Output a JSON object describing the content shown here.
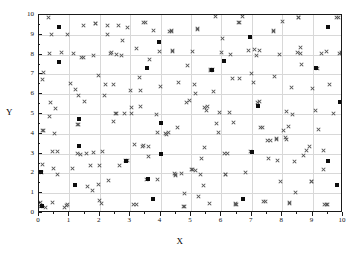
{
  "chart_data": {
    "type": "scatter",
    "title": "",
    "xlabel": "X",
    "ylabel": "Y",
    "xlim": [
      0,
      10
    ],
    "ylim": [
      0,
      10
    ],
    "xticks": [
      0,
      1,
      2,
      3,
      4,
      5,
      6,
      7,
      8,
      9,
      10
    ],
    "yticks": [
      0,
      1,
      2,
      3,
      4,
      5,
      6,
      7,
      8,
      9,
      10
    ],
    "xticklabels": [
      "0",
      "1",
      "2",
      "3",
      "4",
      "5",
      "6",
      "7",
      "8",
      "9",
      "10"
    ],
    "yticklabels": [
      "0",
      "1",
      "2",
      "3",
      "4",
      "5",
      "6",
      "7",
      "8",
      "9",
      "10"
    ],
    "grid": true,
    "minor_ticks": true,
    "legend": null,
    "series": [
      {
        "name": "cross-series",
        "marker": "x",
        "color": "#555555",
        "points": [
          [
            0.05,
            0.35
          ],
          [
            0.05,
            0.55
          ],
          [
            0.08,
            2.05
          ],
          [
            0.1,
            2.45
          ],
          [
            0.12,
            4.15
          ],
          [
            0.1,
            6.75
          ],
          [
            0.15,
            7.1
          ],
          [
            0.3,
            9.85
          ],
          [
            0.35,
            4.85
          ],
          [
            0.38,
            5.6
          ],
          [
            0.4,
            9.0
          ],
          [
            0.45,
            3.1
          ],
          [
            0.48,
            2.25
          ],
          [
            0.5,
            4.0
          ],
          [
            0.55,
            5.3
          ],
          [
            0.6,
            1.95
          ],
          [
            0.75,
            8.1
          ],
          [
            0.85,
            0.3
          ],
          [
            0.9,
            0.4
          ],
          [
            0.95,
            0.45
          ],
          [
            1.05,
            6.55
          ],
          [
            1.1,
            2.25
          ],
          [
            1.15,
            8.05
          ],
          [
            1.2,
            6.25
          ],
          [
            1.25,
            4.45
          ],
          [
            1.3,
            5.95
          ],
          [
            1.35,
            2.95
          ],
          [
            1.4,
            7.85
          ],
          [
            1.45,
            9.45
          ],
          [
            1.5,
            5.65
          ],
          [
            1.55,
            3.0
          ],
          [
            1.6,
            1.35
          ],
          [
            1.7,
            2.4
          ],
          [
            1.75,
            1.15
          ],
          [
            1.78,
            7.95
          ],
          [
            1.8,
            3.05
          ],
          [
            1.85,
            9.55
          ],
          [
            1.95,
            6.95
          ],
          [
            2.0,
            0.65
          ],
          [
            2.05,
            0.5
          ],
          [
            2.1,
            3.1
          ],
          [
            2.15,
            5.95
          ],
          [
            2.2,
            6.5
          ],
          [
            2.25,
            9.0
          ],
          [
            2.3,
            1.65
          ],
          [
            2.4,
            8.1
          ],
          [
            2.45,
            4.6
          ],
          [
            2.5,
            5.05
          ],
          [
            2.55,
            8.0
          ],
          [
            2.6,
            9.45
          ],
          [
            2.65,
            2.4
          ],
          [
            2.7,
            7.95
          ],
          [
            2.75,
            8.7
          ],
          [
            2.8,
            5.05
          ],
          [
            2.85,
            2.65
          ],
          [
            2.9,
            9.35
          ],
          [
            3.0,
            6.2
          ],
          [
            3.05,
            5.35
          ],
          [
            3.1,
            0.45
          ],
          [
            3.15,
            3.45
          ],
          [
            3.2,
            8.3
          ],
          [
            3.3,
            6.85
          ],
          [
            3.35,
            5.4
          ],
          [
            3.4,
            3.35
          ],
          [
            3.45,
            3.4
          ],
          [
            3.5,
            9.6
          ],
          [
            3.55,
            1.7
          ],
          [
            3.6,
            2.85
          ],
          [
            3.65,
            7.75
          ],
          [
            3.75,
            9.2
          ],
          [
            3.85,
            4.95
          ],
          [
            3.9,
            4.05
          ],
          [
            3.95,
            8.15
          ],
          [
            4.0,
            6.4
          ],
          [
            4.15,
            4.0
          ],
          [
            4.2,
            3.95
          ],
          [
            4.3,
            9.15
          ],
          [
            4.35,
            9.15
          ],
          [
            4.4,
            8.15
          ],
          [
            4.45,
            2.0
          ],
          [
            4.5,
            1.9
          ],
          [
            4.55,
            4.3
          ],
          [
            4.6,
            6.6
          ],
          [
            4.7,
            2.0
          ],
          [
            4.75,
            0.35
          ],
          [
            4.8,
            1.0
          ],
          [
            4.85,
            5.6
          ],
          [
            4.9,
            7.45
          ],
          [
            4.95,
            5.7
          ],
          [
            5.0,
            2.2
          ],
          [
            5.05,
            2.2
          ],
          [
            5.1,
            6.5
          ],
          [
            5.15,
            6.05
          ],
          [
            5.2,
            9.3
          ],
          [
            5.25,
            0.85
          ],
          [
            5.3,
            1.95
          ],
          [
            5.35,
            2.75
          ],
          [
            5.4,
            1.4
          ],
          [
            5.45,
            3.3
          ],
          [
            5.5,
            5.2
          ],
          [
            5.55,
            5.4
          ],
          [
            5.6,
            0.5
          ],
          [
            5.65,
            7.2
          ],
          [
            5.7,
            7.25
          ],
          [
            5.75,
            6.15
          ],
          [
            5.8,
            9.9
          ],
          [
            5.85,
            4.5
          ],
          [
            5.9,
            4.05
          ],
          [
            5.95,
            5.1
          ],
          [
            6.0,
            8.1
          ],
          [
            6.05,
            8.8
          ],
          [
            6.1,
            3.0
          ],
          [
            6.15,
            1.95
          ],
          [
            6.2,
            3.0
          ],
          [
            6.3,
            8.0
          ],
          [
            6.35,
            6.8
          ],
          [
            6.4,
            4.55
          ],
          [
            6.45,
            0.5
          ],
          [
            6.5,
            0.45
          ],
          [
            6.6,
            9.6
          ],
          [
            6.7,
            9.9
          ],
          [
            6.8,
            2.05
          ],
          [
            6.9,
            8.2
          ],
          [
            7.0,
            7.05
          ],
          [
            7.05,
            6.6
          ],
          [
            7.1,
            8.25
          ],
          [
            7.15,
            7.95
          ],
          [
            7.2,
            5.6
          ],
          [
            7.25,
            5.65
          ],
          [
            7.3,
            4.3
          ],
          [
            7.4,
            0.6
          ],
          [
            7.5,
            3.65
          ],
          [
            7.55,
            2.75
          ],
          [
            7.6,
            3.65
          ],
          [
            7.7,
            9.2
          ],
          [
            7.75,
            6.9
          ],
          [
            7.8,
            3.75
          ],
          [
            7.85,
            2.65
          ],
          [
            7.9,
            8.0
          ],
          [
            7.95,
            1.6
          ],
          [
            8.0,
            9.65
          ],
          [
            8.05,
            4.15
          ],
          [
            8.1,
            3.8
          ],
          [
            8.15,
            5.15
          ],
          [
            8.2,
            4.35
          ],
          [
            8.25,
            0.5
          ],
          [
            8.3,
            6.35
          ],
          [
            8.35,
            5.0
          ],
          [
            8.4,
            2.6
          ],
          [
            8.45,
            1.05
          ],
          [
            8.5,
            8.1
          ],
          [
            8.55,
            9.85
          ],
          [
            8.6,
            8.35
          ],
          [
            8.65,
            7.5
          ],
          [
            8.7,
            2.9
          ],
          [
            8.8,
            3.15
          ],
          [
            8.9,
            3.35
          ],
          [
            8.95,
            1.6
          ],
          [
            9.0,
            6.3
          ],
          [
            9.1,
            5.2
          ],
          [
            9.2,
            4.2
          ],
          [
            9.3,
            8.05
          ],
          [
            9.35,
            2.2
          ],
          [
            9.4,
            0.45
          ],
          [
            9.5,
            0.45
          ],
          [
            9.55,
            6.5
          ],
          [
            9.7,
            5.05
          ],
          [
            9.8,
            9.85
          ],
          [
            9.9,
            8.05
          ],
          [
            9.95,
            8.1
          ],
          [
            0.2,
            0.3
          ],
          [
            1.95,
            1.45
          ],
          [
            3.9,
            1.7
          ],
          [
            6.95,
            3.1
          ],
          [
            5.15,
            2.15
          ],
          [
            2.9,
            2.65
          ],
          [
            4.25,
            4.05
          ],
          [
            6.25,
            5.1
          ],
          [
            7.35,
            4.3
          ],
          [
            0.6,
            3.1
          ],
          [
            1.25,
            3.0
          ],
          [
            2.0,
            2.4
          ],
          [
            3.6,
            3.35
          ],
          [
            5.45,
            5.35
          ],
          [
            6.6,
            6.8
          ],
          [
            8.15,
            3.7
          ],
          [
            9.15,
            7.3
          ],
          [
            0.35,
            8.05
          ],
          [
            1.45,
            7.85
          ],
          [
            2.35,
            8.05
          ],
          [
            4.4,
            8.2
          ],
          [
            5.05,
            8.15
          ],
          [
            7.25,
            8.2
          ],
          [
            8.6,
            8.05
          ],
          [
            9.45,
            8.15
          ],
          [
            0.95,
            9.0
          ],
          [
            2.25,
            9.45
          ],
          [
            3.45,
            9.6
          ],
          [
            4.35,
            9.2
          ],
          [
            5.2,
            9.25
          ],
          [
            6.55,
            9.6
          ],
          [
            7.7,
            9.15
          ],
          [
            8.55,
            9.85
          ],
          [
            9.85,
            9.85
          ],
          [
            1.85,
            9.55
          ],
          [
            0.45,
            0.55
          ],
          [
            3.2,
            0.45
          ],
          [
            4.8,
            0.35
          ],
          [
            6.45,
            0.45
          ],
          [
            7.45,
            0.6
          ],
          [
            8.25,
            0.55
          ],
          [
            9.45,
            0.45
          ],
          [
            5.65,
            7.25
          ],
          [
            7.8,
            3.7
          ],
          [
            2.55,
            5.05
          ],
          [
            3.05,
            5.05
          ],
          [
            1.3,
            4.45
          ],
          [
            4.5,
            1.95
          ],
          [
            6.15,
            1.95
          ],
          [
            8.95,
            1.6
          ],
          [
            9.35,
            3.15
          ],
          [
            0.15,
            4.15
          ],
          [
            2.45,
            6.5
          ],
          [
            3.35,
            6.2
          ]
        ]
      },
      {
        "name": "dot-series",
        "marker": "filled-square",
        "color": "#0d0d0d",
        "points": [
          [
            0.05,
            2.05
          ],
          [
            0.65,
            9.4
          ],
          [
            0.65,
            7.65
          ],
          [
            1.2,
            1.4
          ],
          [
            1.3,
            4.75
          ],
          [
            1.3,
            3.4
          ],
          [
            3.55,
            7.3
          ],
          [
            3.75,
            0.7
          ],
          [
            3.95,
            8.65
          ],
          [
            4.0,
            4.55
          ],
          [
            4.0,
            3.0
          ],
          [
            3.6,
            1.7
          ],
          [
            6.1,
            7.7
          ],
          [
            6.7,
            0.7
          ],
          [
            6.95,
            8.9
          ],
          [
            7.0,
            3.1
          ],
          [
            7.2,
            5.4
          ],
          [
            9.1,
            7.3
          ],
          [
            9.5,
            9.4
          ],
          [
            9.5,
            2.65
          ],
          [
            9.8,
            1.4
          ],
          [
            9.9,
            5.6
          ],
          [
            5.7,
            7.2
          ],
          [
            2.85,
            2.65
          ],
          [
            0.1,
            0.35
          ]
        ]
      }
    ]
  }
}
